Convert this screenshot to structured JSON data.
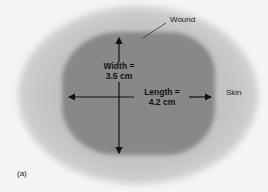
{
  "figure": {
    "panel_label": "(a)",
    "labels": {
      "wound": "Wound",
      "skin": "Skin",
      "width_line1": "Width =",
      "width_line2": "3.5 cm",
      "length_line1": "Length =",
      "length_line2": "4.2 cm"
    },
    "measurements": {
      "width_cm": 3.5,
      "length_cm": 4.2
    },
    "colors": {
      "background": "#f4f4f4",
      "skin": "#c4c4c4",
      "wound": "#888888",
      "arrows": "#111111"
    }
  }
}
